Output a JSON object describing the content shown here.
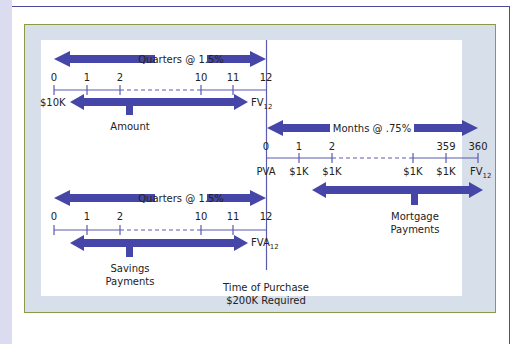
{
  "diagram": {
    "top_left_timeline": {
      "rate_label": "Quarters @ 1.5%",
      "ticks": [
        "0",
        "1",
        "2",
        "10",
        "11",
        "12"
      ],
      "start_value": "$10K",
      "end_value": "FV",
      "end_value_sub": "12",
      "bracket_label": "Amount"
    },
    "right_timeline": {
      "rate_label": "Months @ .75%",
      "ticks": [
        "0",
        "1",
        "2",
        "359",
        "360"
      ],
      "values": [
        "PVA",
        "$1K",
        "$1K",
        "$1K",
        "$1K",
        "FV"
      ],
      "end_value_sub": "12",
      "bracket_label_line1": "Mortgage",
      "bracket_label_line2": "Payments"
    },
    "bottom_left_timeline": {
      "rate_label": "Quarters @ 1.5%",
      "ticks": [
        "0",
        "1",
        "2",
        "10",
        "11",
        "12"
      ],
      "end_value": "FVA",
      "end_value_sub": "12",
      "bracket_label_line1": "Savings",
      "bracket_label_line2": "Payments"
    },
    "purchase_note": {
      "line1": "Time of Purchase",
      "line2": "$200K Required"
    },
    "colors": {
      "arrow": "#4646a8",
      "timeline": "#5a5ab0",
      "panel_bg": "#d6dfea",
      "panel_border": "#8a9a4a",
      "frame": "#4a4aa0"
    }
  }
}
